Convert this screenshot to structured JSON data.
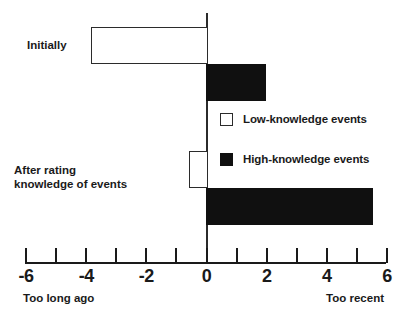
{
  "chart_data": {
    "type": "bar",
    "orientation": "horizontal",
    "title": "",
    "xlabel": "",
    "ylabel": "",
    "xlim": [
      -6,
      6
    ],
    "grid": false,
    "zero_line": true,
    "legend_position": "center-right",
    "categories": [
      "Initially",
      "After rating\nknowledge of events"
    ],
    "series": [
      {
        "name": "Low-knowledge events",
        "values": [
          -3.9,
          -0.6
        ],
        "color": "#ffffff"
      },
      {
        "name": "High-knowledge events",
        "values": [
          2.0,
          5.5
        ],
        "color": "#101010"
      }
    ],
    "xticks": [
      -6,
      -5,
      -4,
      -3,
      -2,
      -1,
      0,
      1,
      2,
      3,
      4,
      5,
      6
    ],
    "xticklabels": [
      "-6",
      "",
      "-4",
      "",
      "-2",
      "",
      "0",
      "",
      "2",
      "",
      "4",
      "",
      "6"
    ],
    "axis_endpoint_labels": {
      "left": "Too long ago",
      "right": "Too recent"
    }
  },
  "categories": {
    "initially": "Initially",
    "after_rating_line1": "After rating",
    "after_rating_line2": "knowledge of events"
  },
  "legend": {
    "items": [
      {
        "label": "Low-knowledge events",
        "swatch": "open-square"
      },
      {
        "label": "High-knowledge events",
        "swatch": "filled-square"
      }
    ]
  },
  "axis": {
    "labels": [
      "-6",
      "-4",
      "-2",
      "0",
      "2",
      "4",
      "6"
    ],
    "left_caption": "Too long ago",
    "right_caption": "Too recent"
  },
  "colors": {
    "ink": "#1a1a1a",
    "bar_fill_high": "#101010",
    "bar_fill_low": "#ffffff",
    "background": "#ffffff"
  }
}
